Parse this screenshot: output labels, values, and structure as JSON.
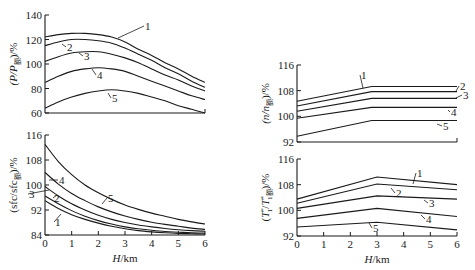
{
  "chart_data": [
    {
      "id": "power",
      "type": "line",
      "title": "",
      "xlabel": "",
      "ylabel": "(P/P额)/%",
      "ylabel_main": "(P/P",
      "ylabel_sub": "额",
      "ylabel_tail": ")/%",
      "xlim": [
        0,
        6
      ],
      "ylim": [
        60,
        140
      ],
      "yticks": [
        60,
        80,
        100,
        120,
        140
      ],
      "xticks": [],
      "grid": false,
      "legend": "curve numbers 1-5 annotated on lines",
      "x": [
        0,
        0.5,
        1,
        1.5,
        2,
        2.5,
        3,
        3.5,
        4,
        4.5,
        5,
        5.5,
        6
      ],
      "series": [
        {
          "name": "1",
          "values": [
            122,
            124,
            125,
            125,
            124,
            122,
            118,
            112,
            107,
            101,
            96,
            90,
            85
          ]
        },
        {
          "name": "2",
          "values": [
            115,
            118,
            120,
            120,
            119,
            117,
            113,
            108,
            103,
            97,
            92,
            86,
            81
          ]
        },
        {
          "name": "3",
          "values": [
            102,
            106,
            109,
            110,
            110,
            108,
            105,
            101,
            96,
            91,
            87,
            82,
            78
          ]
        },
        {
          "name": "4",
          "values": [
            85,
            90,
            94,
            96,
            97,
            96,
            94,
            90,
            86,
            82,
            78,
            74,
            71
          ]
        },
        {
          "name": "5",
          "values": [
            64,
            69,
            73,
            76,
            78,
            79,
            78,
            76,
            73,
            70,
            66,
            63,
            60
          ]
        }
      ]
    },
    {
      "id": "sfc",
      "type": "line",
      "title": "",
      "xlabel": "H/km",
      "ylabel": "(sfc/sfc额)/%",
      "ylabel_main": "(sfc/sfc",
      "ylabel_sub": "额",
      "ylabel_tail": ")/%",
      "xlim": [
        0,
        6
      ],
      "ylim": [
        84,
        116
      ],
      "yticks": [
        84,
        92,
        100,
        108,
        116
      ],
      "xticks": [
        0,
        1,
        2,
        3,
        4,
        5,
        6
      ],
      "grid": false,
      "legend": "curve numbers 1-5 annotated on lines",
      "x": [
        0,
        0.5,
        1,
        1.5,
        2,
        2.5,
        3,
        3.5,
        4,
        4.5,
        5,
        5.5,
        6
      ],
      "series": [
        {
          "name": "1",
          "values": [
            95,
            92.5,
            90.5,
            89,
            87.8,
            86.8,
            86,
            85.4,
            85,
            84.7,
            84.5,
            84.4,
            84.3
          ]
        },
        {
          "name": "2",
          "values": [
            96.5,
            94,
            91.8,
            90,
            88.6,
            87.5,
            86.6,
            86,
            85.5,
            85.1,
            84.9,
            84.7,
            84.6
          ]
        },
        {
          "name": "3",
          "values": [
            99.5,
            96.5,
            94,
            92,
            90.3,
            89,
            88,
            87.2,
            86.6,
            86.1,
            85.7,
            85.4,
            85.2
          ]
        },
        {
          "name": "4",
          "values": [
            104,
            100.3,
            97.3,
            95,
            93,
            91.4,
            90.1,
            89,
            88.1,
            87.4,
            86.8,
            86.2,
            85.8
          ]
        },
        {
          "name": "5",
          "values": [
            113,
            107.5,
            103.3,
            100,
            97.5,
            95.4,
            93.6,
            92.2,
            91,
            90,
            89,
            88.2,
            87.5
          ]
        }
      ]
    },
    {
      "id": "speed",
      "type": "line",
      "title": "",
      "xlabel": "",
      "ylabel": "(n/n额)/%",
      "ylabel_main": "(n/n",
      "ylabel_sub": "额",
      "ylabel_tail": ")/%",
      "xlim": [
        0,
        6
      ],
      "ylim": [
        92,
        116
      ],
      "yticks": [
        92,
        100,
        108,
        116
      ],
      "xticks": [],
      "grid": false,
      "legend": "curve numbers 1-5 annotated on lines",
      "x": [
        0,
        2.8,
        6
      ],
      "series": [
        {
          "name": "1",
          "values": [
            104.7,
            109.3,
            109.3
          ]
        },
        {
          "name": "2",
          "values": [
            103.2,
            107.7,
            107.7
          ]
        },
        {
          "name": "3",
          "values": [
            101.6,
            105.6,
            105.6
          ]
        },
        {
          "name": "4",
          "values": [
            99.4,
            102.8,
            102.8
          ]
        },
        {
          "name": "5",
          "values": [
            93.8,
            98.7,
            98.7
          ]
        }
      ]
    },
    {
      "id": "temperature",
      "type": "line",
      "title": "",
      "xlabel": "H/km",
      "ylabel": "(T*₁/T*₁额)/%",
      "ylabel_main": "(T*",
      "ylabel_mid": "/T*",
      "ylabel_sub": "1额",
      "ylabel_tail": ")/%",
      "xlim": [
        0,
        6
      ],
      "ylim": [
        92,
        116
      ],
      "yticks": [
        92,
        100,
        108,
        116
      ],
      "xticks": [
        0,
        1,
        2,
        3,
        4,
        5,
        6
      ],
      "grid": false,
      "legend": "curve numbers 1-5 annotated on lines",
      "x": [
        0,
        3,
        6
      ],
      "series": [
        {
          "name": "1",
          "values": [
            103.5,
            110.4,
            108
          ]
        },
        {
          "name": "2",
          "values": [
            102.2,
            108.2,
            106.4
          ]
        },
        {
          "name": "3",
          "values": [
            100.6,
            104.5,
            103.5
          ]
        },
        {
          "name": "4",
          "values": [
            97.5,
            100.6,
            98.1
          ]
        },
        {
          "name": "5",
          "values": [
            94.8,
            96.3,
            93.9
          ]
        }
      ]
    }
  ],
  "layout": {
    "panels": {
      "power": {
        "x0": 45,
        "x1": 205,
        "y_top": 15,
        "y_bot": 113,
        "curve_labels": [
          {
            "text": "1",
            "x": 145,
            "y": 30,
            "lx": 118,
            "ly": 38
          },
          {
            "text": "2",
            "x": 67,
            "y": 51,
            "lx": 62,
            "ly": 44
          },
          {
            "text": "3",
            "x": 84,
            "y": 60,
            "lx": 79,
            "ly": 53
          },
          {
            "text": "4",
            "x": 97,
            "y": 79,
            "lx": 92,
            "ly": 69
          },
          {
            "text": "5",
            "x": 112,
            "y": 102,
            "lx": 108,
            "ly": 93
          }
        ]
      },
      "sfc": {
        "x0": 45,
        "x1": 205,
        "y_top": 135,
        "y_bot": 235,
        "curve_labels": [
          {
            "text": "1",
            "x": 55,
            "y": 226,
            "lx": 61,
            "ly": 214
          },
          {
            "text": "2",
            "x": 54,
            "y": 202,
            "lx": 57,
            "ly": 195
          },
          {
            "text": "3",
            "x": 29,
            "y": 198,
            "lx": 49,
            "ly": 190
          },
          {
            "text": "4",
            "x": 59,
            "y": 184,
            "lx": 49,
            "ly": 180
          },
          {
            "text": "5",
            "x": 108,
            "y": 202,
            "lx": 102,
            "ly": 204
          }
        ]
      },
      "speed": {
        "x0": 297,
        "x1": 457,
        "y_top": 65,
        "y_bot": 142,
        "curve_labels": [
          {
            "text": "1",
            "x": 361,
            "y": 79,
            "lx": 363,
            "ly": 88
          },
          {
            "text": "2",
            "x": 460,
            "y": 90,
            "lx": 456,
            "ly": 91
          },
          {
            "text": "3",
            "x": 463,
            "y": 99,
            "lx": 456,
            "ly": 98
          },
          {
            "text": "4",
            "x": 451,
            "y": 116,
            "lx": 448,
            "ly": 110
          },
          {
            "text": "5",
            "x": 443,
            "y": 130,
            "lx": 437,
            "ly": 124
          }
        ]
      },
      "temperature": {
        "x0": 297,
        "x1": 457,
        "y_top": 159,
        "y_bot": 236,
        "curve_labels": [
          {
            "text": "1",
            "x": 417,
            "y": 177,
            "lx": 413,
            "ly": 184
          },
          {
            "text": "2",
            "x": 396,
            "y": 197,
            "lx": 391,
            "ly": 188
          },
          {
            "text": "3",
            "x": 429,
            "y": 207,
            "lx": 424,
            "ly": 200
          },
          {
            "text": "4",
            "x": 426,
            "y": 223,
            "lx": 421,
            "ly": 215
          },
          {
            "text": "5",
            "x": 373,
            "y": 232,
            "lx": 369,
            "ly": 223
          }
        ]
      }
    }
  }
}
